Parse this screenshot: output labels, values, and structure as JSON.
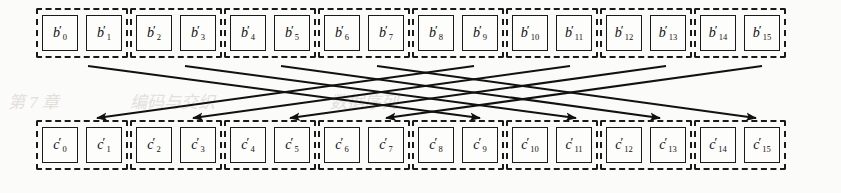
{
  "figure": {
    "type": "permutation-interleaver-diagram",
    "arrow_color": "#111111",
    "box_border_color": "#1a1a1a",
    "cell_border_color": "#1a1a1a",
    "background_color": "#fbfbf9"
  },
  "top_row": {
    "name": "b-prime-row",
    "groups": [
      {
        "cells": [
          {
            "base": "b",
            "prime": "′",
            "index": "0"
          },
          {
            "base": "b",
            "prime": "′",
            "index": "1"
          }
        ]
      },
      {
        "cells": [
          {
            "base": "b",
            "prime": "′",
            "index": "2"
          },
          {
            "base": "b",
            "prime": "′",
            "index": "3"
          }
        ]
      },
      {
        "cells": [
          {
            "base": "b",
            "prime": "′",
            "index": "4"
          },
          {
            "base": "b",
            "prime": "′",
            "index": "5"
          }
        ]
      },
      {
        "cells": [
          {
            "base": "b",
            "prime": "′",
            "index": "6"
          },
          {
            "base": "b",
            "prime": "′",
            "index": "7"
          }
        ]
      },
      {
        "cells": [
          {
            "base": "b",
            "prime": "′",
            "index": "8"
          },
          {
            "base": "b",
            "prime": "′",
            "index": "9"
          }
        ]
      },
      {
        "cells": [
          {
            "base": "b",
            "prime": "′",
            "index": "10"
          },
          {
            "base": "b",
            "prime": "′",
            "index": "11"
          }
        ]
      },
      {
        "cells": [
          {
            "base": "b",
            "prime": "′",
            "index": "12"
          },
          {
            "base": "b",
            "prime": "′",
            "index": "13"
          }
        ]
      },
      {
        "cells": [
          {
            "base": "b",
            "prime": "′",
            "index": "14"
          },
          {
            "base": "b",
            "prime": "′",
            "index": "15"
          }
        ]
      }
    ]
  },
  "bottom_row": {
    "name": "c-prime-row",
    "groups": [
      {
        "cells": [
          {
            "base": "c",
            "prime": "′",
            "index": "0"
          },
          {
            "base": "c",
            "prime": "′",
            "index": "1"
          }
        ]
      },
      {
        "cells": [
          {
            "base": "c",
            "prime": "′",
            "index": "2"
          },
          {
            "base": "c",
            "prime": "′",
            "index": "3"
          }
        ]
      },
      {
        "cells": [
          {
            "base": "c",
            "prime": "′",
            "index": "4"
          },
          {
            "base": "c",
            "prime": "′",
            "index": "5"
          }
        ]
      },
      {
        "cells": [
          {
            "base": "c",
            "prime": "′",
            "index": "6"
          },
          {
            "base": "c",
            "prime": "′",
            "index": "7"
          }
        ]
      },
      {
        "cells": [
          {
            "base": "c",
            "prime": "′",
            "index": "8"
          },
          {
            "base": "c",
            "prime": "′",
            "index": "9"
          }
        ]
      },
      {
        "cells": [
          {
            "base": "c",
            "prime": "′",
            "index": "10"
          },
          {
            "base": "c",
            "prime": "′",
            "index": "11"
          }
        ]
      },
      {
        "cells": [
          {
            "base": "c",
            "prime": "′",
            "index": "12"
          },
          {
            "base": "c",
            "prime": "′",
            "index": "13"
          }
        ]
      },
      {
        "cells": [
          {
            "base": "c",
            "prime": "′",
            "index": "14"
          },
          {
            "base": "c",
            "prime": "′",
            "index": "15"
          }
        ]
      }
    ]
  },
  "arrows": [
    {
      "from_group": 0,
      "to_group": 4,
      "x1": 88,
      "y1": 66,
      "x2": 480,
      "y2": 118,
      "direction": "right-down"
    },
    {
      "from_group": 1,
      "to_group": 5,
      "x1": 185,
      "y1": 66,
      "x2": 576,
      "y2": 118,
      "direction": "right-down"
    },
    {
      "from_group": 2,
      "to_group": 6,
      "x1": 281,
      "y1": 66,
      "x2": 660,
      "y2": 118,
      "direction": "right-down"
    },
    {
      "from_group": 3,
      "to_group": 7,
      "x1": 377,
      "y1": 66,
      "x2": 756,
      "y2": 118,
      "direction": "right-down"
    },
    {
      "from_group": 4,
      "to_group": 0,
      "x1": 474,
      "y1": 66,
      "x2": 97,
      "y2": 118,
      "direction": "left-down"
    },
    {
      "from_group": 5,
      "to_group": 1,
      "x1": 570,
      "y1": 66,
      "x2": 193,
      "y2": 118,
      "direction": "left-down"
    },
    {
      "from_group": 6,
      "to_group": 2,
      "x1": 666,
      "y1": 66,
      "x2": 290,
      "y2": 118,
      "direction": "left-down"
    },
    {
      "from_group": 7,
      "to_group": 3,
      "x1": 762,
      "y1": 66,
      "x2": 386,
      "y2": 118,
      "direction": "left-down"
    }
  ],
  "ghost_text": {
    "line1": "第 7 章",
    "line2": "编码与交织",
    "line3": "数据序列"
  }
}
